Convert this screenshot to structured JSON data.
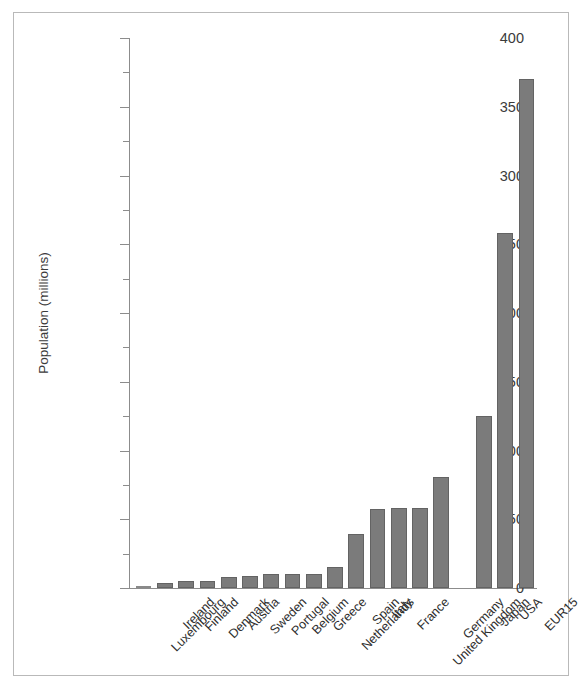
{
  "chart_data": {
    "type": "bar",
    "title": "",
    "xlabel": "",
    "ylabel": "Population (millions)",
    "ylim": [
      0,
      400
    ],
    "ytick_major": [
      0,
      50,
      100,
      150,
      200,
      250,
      300,
      350,
      400
    ],
    "ytick_minor": [
      25,
      75,
      125,
      175,
      225,
      275,
      325,
      375
    ],
    "grid": false,
    "legend": null,
    "orientation": "vertical",
    "bar_color": "#7b7b7b",
    "bar_edge_color": "#636363",
    "axis_color": "#8c8c8c",
    "frame_color": "#b9b9b9",
    "categories": [
      "Luxembourg",
      "Ireland",
      "Finland",
      "Denmark",
      "Austria",
      "Sweden",
      "Portugal",
      "Belgium",
      "Greece",
      "Netherlands",
      "Spain",
      "Italy",
      "France",
      "United Kingdom",
      "Germany",
      "Japan",
      "USA",
      "EUR15"
    ],
    "values": [
      0.4,
      3.7,
      5.1,
      5.3,
      8.1,
      8.9,
      9.9,
      10.2,
      10.5,
      15.6,
      39.2,
      57.5,
      58.0,
      58.5,
      81.0,
      125.0,
      258.0,
      370.0
    ],
    "group_gap_after_index": 14
  },
  "yaxis": {
    "labels": [
      "400",
      "350",
      "300",
      "250",
      "200",
      "150",
      "100",
      "50",
      "0"
    ],
    "title": "Population (millions)"
  }
}
